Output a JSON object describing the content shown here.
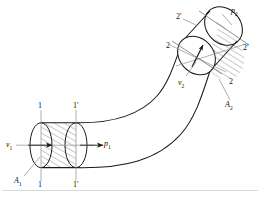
{
  "figure": {
    "background_color": "#ffffff",
    "line_color": "#1a1a1a",
    "hatch_color": "#444444",
    "centerline_color": "#9a9a9a"
  },
  "labels": {
    "inlet_velocity": "v",
    "inlet_velocity_sub": "1",
    "inlet_pressure": "p",
    "inlet_pressure_sub": "1",
    "inlet_area": "A",
    "inlet_area_sub": "1",
    "outlet_velocity": "v",
    "outlet_velocity_sub": "2",
    "outlet_pressure": "p",
    "outlet_pressure_sub": "2",
    "outlet_area": "A",
    "outlet_area_sub": "2",
    "section_1_top": "1",
    "section_1_bottom": "1",
    "section_1prime_top": "1′",
    "section_1prime_bottom": "1′",
    "section_2_upper": "2",
    "section_2_lower": "2",
    "section_2prime_upper": "2′",
    "section_2prime_lower": "2′"
  }
}
